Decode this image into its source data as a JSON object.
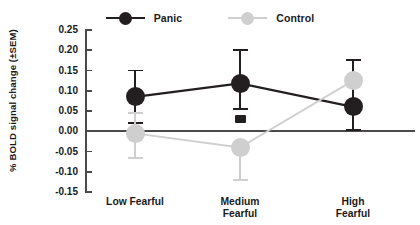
{
  "title": {
    "text": "",
    "note": "title cropped off at top edge"
  },
  "legend": {
    "position": "top-center",
    "entries": [
      {
        "label": "Panic",
        "color": "#231f20",
        "marker": "circle"
      },
      {
        "label": "Control",
        "color": "#cfcfcf",
        "marker": "circle"
      }
    ]
  },
  "axis": {
    "ylabel": "% BOLD signal change (±SEM)",
    "yticks": [
      "0.25",
      "0.20",
      "0.15",
      "0.10",
      "0.05",
      "0.00",
      "-0.05",
      "-0.10",
      "-0.15"
    ],
    "ytick_values": [
      0.25,
      0.2,
      0.15,
      0.1,
      0.05,
      0.0,
      -0.05,
      -0.1,
      -0.15
    ],
    "ylim": [
      -0.15,
      0.25
    ],
    "xlabels": [
      "Low Fearful",
      "Medium\nFearful",
      "High\nFearful"
    ],
    "grid": false
  },
  "chart_data": {
    "type": "line",
    "title": "",
    "xlabel": "",
    "ylabel": "% BOLD signal change (±SEM)",
    "categories": [
      "Low Fearful",
      "Medium Fearful",
      "High Fearful"
    ],
    "ylim": [
      -0.15,
      0.25
    ],
    "grid": false,
    "legend_position": "top-center",
    "error_type": "SEM",
    "series": [
      {
        "name": "Panic",
        "color": "#231f20",
        "values": [
          0.085,
          0.118,
          0.06
        ],
        "err_low": [
          0.02,
          0.055,
          0.003
        ],
        "err_high": [
          0.15,
          0.2,
          0.177
        ]
      },
      {
        "name": "Control",
        "color": "#cfcfcf",
        "values": [
          -0.005,
          -0.04,
          0.125
        ],
        "err_low": [
          -0.065,
          -0.12,
          0.125
        ],
        "err_high": [
          0.045,
          -0.04,
          0.125
        ]
      }
    ],
    "annotations": [
      {
        "name": "black-square-marker",
        "category": "Medium Fearful",
        "value": 0.03,
        "color": "#231f20",
        "marker": "square"
      }
    ]
  }
}
